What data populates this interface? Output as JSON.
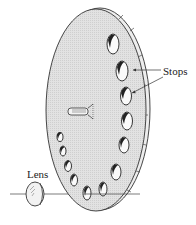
{
  "diagram": {
    "type": "aperture-stop-disc",
    "labels": {
      "stops": "Stops",
      "lens": "Lens"
    },
    "colors": {
      "disc_fill": "#dcdcdc",
      "line": "#333333",
      "background": "#ffffff",
      "hole_shadow": "#222222"
    },
    "components": [
      "disc",
      "disc-rim",
      "stops (12 apertures)",
      "central-hub",
      "lens",
      "optical-axis"
    ],
    "stop_count": 12
  }
}
